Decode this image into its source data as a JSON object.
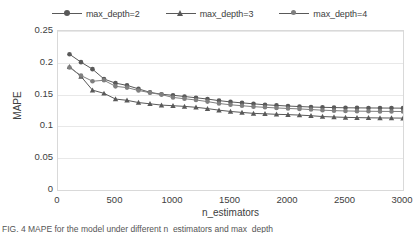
{
  "chart_data": {
    "type": "line",
    "title": "",
    "xlabel": "n_estimators",
    "ylabel": "MAPE",
    "xlim": [
      0,
      3000
    ],
    "ylim": [
      0,
      0.25
    ],
    "xticks": [
      "0",
      "500",
      "1000",
      "1500",
      "2000",
      "2500",
      "3000"
    ],
    "yticks": [
      "0",
      "0.05",
      "0.1",
      "0.15",
      "0.2",
      "0.25"
    ],
    "xtick_values": [
      0,
      500,
      1000,
      1500,
      2000,
      2500,
      3000
    ],
    "ytick_values": [
      0,
      0.05,
      0.1,
      0.15,
      0.2,
      0.25
    ],
    "grid": "horizontal",
    "legend_position": "top-center",
    "x": [
      100,
      200,
      300,
      400,
      500,
      600,
      700,
      800,
      900,
      1000,
      1100,
      1200,
      1300,
      1400,
      1500,
      1600,
      1700,
      1800,
      1900,
      2000,
      2100,
      2200,
      2300,
      2400,
      2500,
      2600,
      2700,
      2800,
      2900,
      3000
    ],
    "series": [
      {
        "name": "max_depth=2",
        "marker": "circle",
        "color": "#595959",
        "values": [
          0.2135,
          0.201,
          0.19,
          0.1745,
          0.168,
          0.1645,
          0.159,
          0.1535,
          0.1505,
          0.149,
          0.147,
          0.145,
          0.143,
          0.1405,
          0.1385,
          0.137,
          0.1355,
          0.134,
          0.133,
          0.132,
          0.1312,
          0.1305,
          0.13,
          0.1296,
          0.1293,
          0.1291,
          0.129,
          0.1289,
          0.1288,
          0.1287
        ]
      },
      {
        "name": "max_depth=3",
        "marker": "triangle",
        "color": "#595959",
        "values": [
          0.194,
          0.1785,
          0.157,
          0.152,
          0.143,
          0.141,
          0.1375,
          0.1355,
          0.1335,
          0.1325,
          0.1315,
          0.13,
          0.128,
          0.1255,
          0.1235,
          0.122,
          0.1205,
          0.1198,
          0.119,
          0.1185,
          0.1178,
          0.1168,
          0.1155,
          0.1148,
          0.1142,
          0.1138,
          0.1135,
          0.1133,
          0.1132,
          0.113
        ]
      },
      {
        "name": "max_depth=4",
        "marker": "circle",
        "color": "#7f7f7f",
        "values": [
          0.1925,
          0.18,
          0.171,
          0.1725,
          0.163,
          0.161,
          0.1565,
          0.153,
          0.15,
          0.1455,
          0.1435,
          0.1415,
          0.139,
          0.136,
          0.134,
          0.1325,
          0.131,
          0.13,
          0.129,
          0.1282,
          0.1275,
          0.1265,
          0.1255,
          0.1248,
          0.1243,
          0.124,
          0.1238,
          0.1236,
          0.1235,
          0.1234
        ]
      }
    ]
  },
  "caption": "FIG. 4  MAPE for the model under different n_estimators and max_depth"
}
